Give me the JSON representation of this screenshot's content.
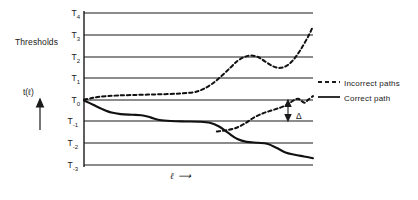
{
  "chart_data": {
    "type": "line",
    "title": "",
    "xlabel": "ℓ",
    "ylabel": "t(ℓ)",
    "grid": true,
    "legend_position": "right",
    "axis_annotation_left": "Thresholds",
    "gap_annotation": "Δ",
    "y_ticks": [
      {
        "label": "T",
        "sub": "4",
        "value": 4
      },
      {
        "label": "T",
        "sub": "3",
        "value": 3
      },
      {
        "label": "T",
        "sub": "2",
        "value": 2
      },
      {
        "label": "T",
        "sub": "1",
        "value": 1
      },
      {
        "label": "T",
        "sub": "0",
        "value": 0
      },
      {
        "label": "T",
        "sub": "-1",
        "value": -1
      },
      {
        "label": "T",
        "sub": "-2",
        "value": -2
      },
      {
        "label": "T",
        "sub": "-3",
        "value": -3
      }
    ],
    "ylim": [
      -3,
      4
    ],
    "xlim": [
      0,
      100
    ],
    "series": [
      {
        "name": "Incorrect paths",
        "style": "dashed",
        "color": "#111111",
        "points": [
          [
            0.0,
            0.02
          ],
          [
            3.0,
            0.08
          ],
          [
            6.0,
            0.14
          ],
          [
            10.0,
            0.18
          ],
          [
            15.0,
            0.21
          ],
          [
            21.0,
            0.23
          ],
          [
            28.0,
            0.25
          ],
          [
            35.0,
            0.27
          ],
          [
            42.0,
            0.3
          ],
          [
            48.0,
            0.36
          ],
          [
            52.0,
            0.5
          ],
          [
            56.0,
            0.75
          ],
          [
            60.0,
            1.1
          ],
          [
            64.0,
            1.5
          ],
          [
            67.0,
            1.8
          ],
          [
            70.0,
            1.98
          ],
          [
            73.0,
            2.05
          ],
          [
            76.0,
            1.98
          ],
          [
            79.0,
            1.78
          ],
          [
            82.0,
            1.58
          ],
          [
            85.0,
            1.48
          ],
          [
            88.0,
            1.55
          ],
          [
            91.0,
            1.8
          ],
          [
            94.5,
            2.3
          ],
          [
            98.0,
            2.95
          ],
          [
            100.0,
            3.4
          ]
        ]
      },
      {
        "name": "Incorrect paths",
        "style": "dashed",
        "color": "#111111",
        "points": [
          [
            58.0,
            -1.45
          ],
          [
            62.0,
            -1.4
          ],
          [
            66.0,
            -1.3
          ],
          [
            70.0,
            -1.1
          ],
          [
            74.0,
            -0.82
          ],
          [
            78.0,
            -0.62
          ],
          [
            82.0,
            -0.48
          ],
          [
            86.0,
            -0.34
          ],
          [
            89.0,
            -0.2
          ],
          [
            91.5,
            -0.02
          ],
          [
            93.5,
            0.06
          ],
          [
            95.0,
            -0.05
          ],
          [
            96.5,
            -0.12
          ],
          [
            98.0,
            0.02
          ],
          [
            100.0,
            0.18
          ]
        ]
      },
      {
        "name": "Correct path",
        "style": "solid",
        "color": "#111111",
        "points": [
          [
            0.0,
            -0.02
          ],
          [
            4.0,
            -0.22
          ],
          [
            8.0,
            -0.42
          ],
          [
            12.0,
            -0.58
          ],
          [
            16.0,
            -0.65
          ],
          [
            21.0,
            -0.68
          ],
          [
            25.0,
            -0.7
          ],
          [
            29.0,
            -0.8
          ],
          [
            33.0,
            -0.92
          ],
          [
            38.0,
            -0.97
          ],
          [
            44.0,
            -0.99
          ],
          [
            50.0,
            -1.0
          ],
          [
            55.0,
            -1.05
          ],
          [
            59.0,
            -1.22
          ],
          [
            63.0,
            -1.52
          ],
          [
            67.0,
            -1.8
          ],
          [
            71.0,
            -1.93
          ],
          [
            76.0,
            -1.97
          ],
          [
            80.0,
            -2.02
          ],
          [
            84.0,
            -2.2
          ],
          [
            88.0,
            -2.42
          ],
          [
            92.0,
            -2.52
          ],
          [
            96.0,
            -2.6
          ],
          [
            100.0,
            -2.68
          ]
        ]
      }
    ],
    "legend": [
      {
        "label": "Incorrect paths",
        "style": "dashed"
      },
      {
        "label": "Correct path",
        "style": "solid"
      }
    ]
  }
}
